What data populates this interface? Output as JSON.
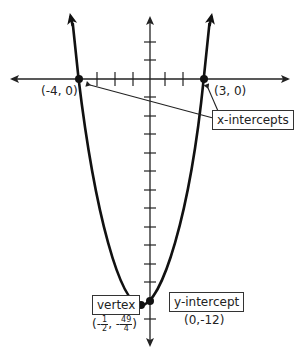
{
  "diagram": {
    "type": "parabola-graph",
    "colors": {
      "line": "#111111",
      "axis": "#222222",
      "label": "#222222"
    },
    "labels": {
      "x_intercept_left": "(-4, 0)",
      "x_intercept_right": "(3, 0)",
      "x_intercepts_box": "x-intercepts",
      "vertex_box": "vertex",
      "vertex_coord": {
        "open": "(",
        "minus1": "-",
        "x_num": "1",
        "x_den": "2",
        "sep": ", ",
        "minus2": "-",
        "y_num": "49",
        "y_den": "4",
        "close": ")"
      },
      "y_intercept_box": "y-intercept",
      "y_intercept_coord": "(0,-12)"
    },
    "points": {
      "x_intercepts": [
        [
          -4,
          0
        ],
        [
          3,
          0
        ]
      ],
      "vertex": [
        -0.5,
        -12.25
      ],
      "y_intercept": [
        0,
        -12
      ]
    },
    "equation_implied": "y = x^2 + x - 12"
  }
}
